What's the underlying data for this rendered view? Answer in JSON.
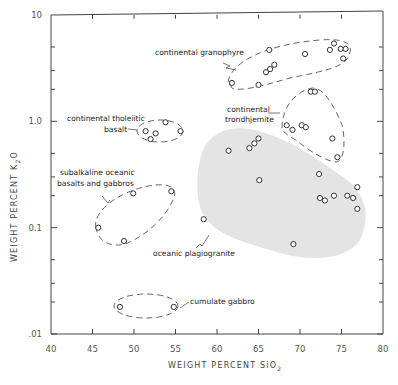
{
  "chart_data": {
    "type": "scatter",
    "title": "",
    "xlabel": "WEIGHT PERCENT SiO2",
    "ylabel": "WEIGHT PERCENT K2O",
    "xlim": [
      40,
      80
    ],
    "ylim": [
      0.01,
      10
    ],
    "yscale": "log",
    "grid": false,
    "x_ticks": [
      40,
      45,
      50,
      55,
      60,
      65,
      70,
      75,
      80
    ],
    "y_tick_labels": [
      {
        "value": 10,
        "label": "10"
      },
      {
        "value": 1.0,
        "label": "1.0"
      },
      {
        "value": 0.1,
        "label": "0.1"
      },
      {
        "value": 0.01,
        "label": ".01"
      }
    ],
    "series": [
      {
        "name": "continental granophyre",
        "marker": "open-circle",
        "points": [
          [
            61.8,
            2.3
          ],
          [
            65.0,
            2.2
          ],
          [
            66.3,
            4.7
          ],
          [
            65.9,
            2.9
          ],
          [
            66.4,
            3.1
          ],
          [
            66.9,
            3.4
          ],
          [
            70.6,
            4.3
          ],
          [
            73.6,
            4.7
          ],
          [
            74.1,
            5.4
          ],
          [
            74.9,
            4.8
          ],
          [
            75.5,
            4.8
          ],
          [
            75.2,
            3.9
          ]
        ]
      },
      {
        "name": "continental trondhjemite",
        "marker": "open-circle",
        "points": [
          [
            71.3,
            1.9
          ],
          [
            71.8,
            1.9
          ],
          [
            68.4,
            0.92
          ],
          [
            69.1,
            0.83
          ],
          [
            70.2,
            0.92
          ],
          [
            70.7,
            0.88
          ],
          [
            73.9,
            0.69
          ],
          [
            74.5,
            0.46
          ]
        ]
      },
      {
        "name": "continental tholeiitic basalt",
        "marker": "open-circle",
        "points": [
          [
            51.4,
            0.81
          ],
          [
            52.0,
            0.68
          ],
          [
            52.6,
            0.77
          ],
          [
            53.8,
            0.98
          ],
          [
            55.6,
            0.81
          ]
        ]
      },
      {
        "name": "oceanic plagiogranite",
        "marker": "open-circle",
        "shaded_region": true,
        "points": [
          [
            61.4,
            0.53
          ],
          [
            63.9,
            0.56
          ],
          [
            64.5,
            0.62
          ],
          [
            65.0,
            0.69
          ],
          [
            65.1,
            0.28
          ],
          [
            58.4,
            0.12
          ],
          [
            69.2,
            0.07
          ],
          [
            72.3,
            0.32
          ],
          [
            72.4,
            0.19
          ],
          [
            73.0,
            0.18
          ],
          [
            74.1,
            0.2
          ],
          [
            75.7,
            0.2
          ],
          [
            76.4,
            0.19
          ],
          [
            76.9,
            0.24
          ],
          [
            76.9,
            0.15
          ]
        ]
      },
      {
        "name": "subalkaline oceanic basalts and gabbros",
        "marker": "open-circle",
        "points": [
          [
            49.9,
            0.21
          ],
          [
            54.5,
            0.22
          ],
          [
            45.7,
            0.1
          ],
          [
            48.8,
            0.075
          ]
        ]
      },
      {
        "name": "cumulate gabbro",
        "marker": "open-circle",
        "points": [
          [
            48.3,
            0.018
          ],
          [
            54.8,
            0.018
          ]
        ]
      }
    ],
    "annotations": [
      "continental granophyre",
      "continental tholeiitic basalt",
      "continental trondhjemite",
      "subalkaline oceanic basalts and gabbros",
      "oceanic plagiogranite",
      "cumulate gabbro"
    ]
  },
  "labels": {
    "granophyre": "continental granophyre",
    "tholeiitic_1": "continental tholeiitic",
    "tholeiitic_2": "basalt",
    "trondhjemite_1": "continental",
    "trondhjemite_2": "trondhjemite",
    "subalkaline_1": "subalkaline oceanic",
    "subalkaline_2": "basalts and gabbros",
    "plagiogranite": "oceanic plagiogranite",
    "cumulate": "cumulate gabbro",
    "xlabel_main": "WEIGHT   PERCENT  SiO",
    "xlabel_sub": "2",
    "ylabel_main": "WEIGHT   PERCENT   K",
    "ylabel_sub": "2",
    "ylabel_end": "O"
  }
}
